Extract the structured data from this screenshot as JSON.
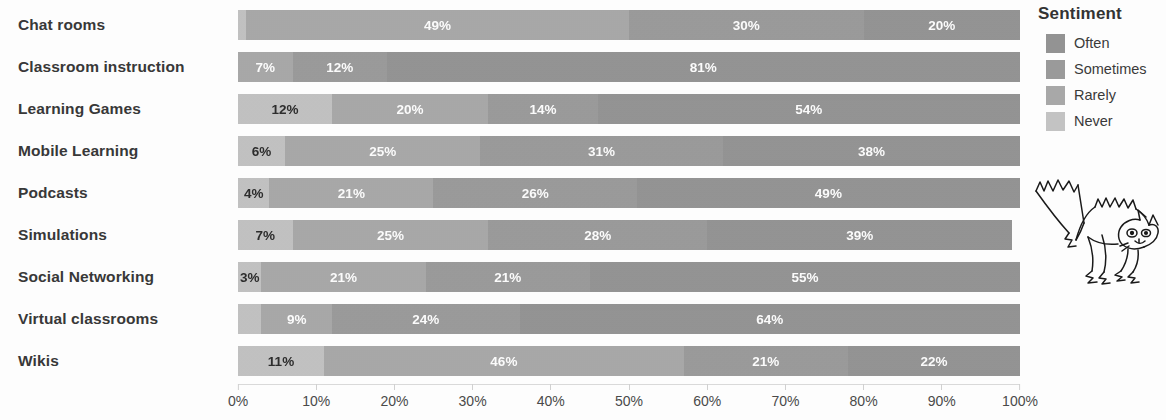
{
  "chart_data": {
    "type": "bar",
    "orientation": "horizontal",
    "stacked": true,
    "normalized": "100%",
    "title": "",
    "xlabel": "",
    "ylabel": "",
    "xlim": [
      0,
      100
    ],
    "grid": false,
    "legend_position": "right",
    "legend_title": "Sentiment",
    "x_ticks": [
      "0%",
      "10%",
      "20%",
      "30%",
      "40%",
      "50%",
      "60%",
      "70%",
      "80%",
      "90%",
      "100%"
    ],
    "x_tick_values": [
      0,
      10,
      20,
      30,
      40,
      50,
      60,
      70,
      80,
      90,
      100
    ],
    "categories": [
      "Chat rooms",
      "Classroom instruction",
      "Learning Games",
      "Mobile Learning",
      "Podcasts",
      "Simulations",
      "Social Networking",
      "Virtual classrooms",
      "Wikis"
    ],
    "series": [
      {
        "name": "Never",
        "color": "#c3c3c3",
        "values": [
          1,
          0,
          12,
          6,
          4,
          7,
          3,
          3,
          11
        ]
      },
      {
        "name": "Rarely",
        "color": "#a8a8a8",
        "values": [
          49,
          7,
          20,
          25,
          21,
          25,
          21,
          9,
          46
        ]
      },
      {
        "name": "Sometimes",
        "color": "#9a9a9a",
        "values": [
          30,
          12,
          14,
          31,
          26,
          28,
          21,
          24,
          21
        ]
      },
      {
        "name": "Often",
        "color": "#939393",
        "values": [
          20,
          81,
          54,
          38,
          49,
          39,
          55,
          64,
          22
        ]
      }
    ],
    "bars": [
      {
        "category": "Chat rooms",
        "segments": [
          {
            "series": "Never",
            "value": 1,
            "label": "",
            "show_label": false
          },
          {
            "series": "Rarely",
            "value": 49,
            "label": "49%",
            "show_label": true
          },
          {
            "series": "Sometimes",
            "value": 30,
            "label": "30%",
            "show_label": true
          },
          {
            "series": "Often",
            "value": 20,
            "label": "20%",
            "show_label": true
          }
        ]
      },
      {
        "category": "Classroom instruction",
        "segments": [
          {
            "series": "Never",
            "value": 0,
            "label": "",
            "show_label": false
          },
          {
            "series": "Rarely",
            "value": 7,
            "label": "7%",
            "show_label": true
          },
          {
            "series": "Sometimes",
            "value": 12,
            "label": "12%",
            "show_label": true
          },
          {
            "series": "Often",
            "value": 81,
            "label": "81%",
            "show_label": true
          }
        ]
      },
      {
        "category": "Learning Games",
        "segments": [
          {
            "series": "Never",
            "value": 12,
            "label": "12%",
            "show_label": true
          },
          {
            "series": "Rarely",
            "value": 20,
            "label": "20%",
            "show_label": true
          },
          {
            "series": "Sometimes",
            "value": 14,
            "label": "14%",
            "show_label": true
          },
          {
            "series": "Often",
            "value": 54,
            "label": "54%",
            "show_label": true
          }
        ]
      },
      {
        "category": "Mobile Learning",
        "segments": [
          {
            "series": "Never",
            "value": 6,
            "label": "6%",
            "show_label": true
          },
          {
            "series": "Rarely",
            "value": 25,
            "label": "25%",
            "show_label": true
          },
          {
            "series": "Sometimes",
            "value": 31,
            "label": "31%",
            "show_label": true
          },
          {
            "series": "Often",
            "value": 38,
            "label": "38%",
            "show_label": true
          }
        ]
      },
      {
        "category": "Podcasts",
        "segments": [
          {
            "series": "Never",
            "value": 4,
            "label": "4%",
            "show_label": true
          },
          {
            "series": "Rarely",
            "value": 21,
            "label": "21%",
            "show_label": true
          },
          {
            "series": "Sometimes",
            "value": 26,
            "label": "26%",
            "show_label": true
          },
          {
            "series": "Often",
            "value": 49,
            "label": "49%",
            "show_label": true
          }
        ]
      },
      {
        "category": "Simulations",
        "segments": [
          {
            "series": "Never",
            "value": 7,
            "label": "7%",
            "show_label": true
          },
          {
            "series": "Rarely",
            "value": 25,
            "label": "25%",
            "show_label": true
          },
          {
            "series": "Sometimes",
            "value": 28,
            "label": "28%",
            "show_label": true
          },
          {
            "series": "Often",
            "value": 39,
            "label": "39%",
            "show_label": true
          }
        ]
      },
      {
        "category": "Social Networking",
        "segments": [
          {
            "series": "Never",
            "value": 3,
            "label": "3%",
            "show_label": true
          },
          {
            "series": "Rarely",
            "value": 21,
            "label": "21%",
            "show_label": true
          },
          {
            "series": "Sometimes",
            "value": 21,
            "label": "21%",
            "show_label": true
          },
          {
            "series": "Often",
            "value": 55,
            "label": "55%",
            "show_label": true
          }
        ]
      },
      {
        "category": "Virtual classrooms",
        "segments": [
          {
            "series": "Never",
            "value": 3,
            "label": "",
            "show_label": false
          },
          {
            "series": "Rarely",
            "value": 9,
            "label": "9%",
            "show_label": true
          },
          {
            "series": "Sometimes",
            "value": 24,
            "label": "24%",
            "show_label": true
          },
          {
            "series": "Often",
            "value": 64,
            "label": "64%",
            "show_label": true
          }
        ]
      },
      {
        "category": "Wikis",
        "segments": [
          {
            "series": "Never",
            "value": 11,
            "label": "11%",
            "show_label": true
          },
          {
            "series": "Rarely",
            "value": 46,
            "label": "46%",
            "show_label": true
          },
          {
            "series": "Sometimes",
            "value": 21,
            "label": "21%",
            "show_label": true
          },
          {
            "series": "Often",
            "value": 22,
            "label": "22%",
            "show_label": true
          }
        ]
      }
    ]
  },
  "legend": {
    "title": "Sentiment",
    "items": [
      {
        "label": "Often",
        "color": "#939393"
      },
      {
        "label": "Sometimes",
        "color": "#9a9a9a"
      },
      {
        "label": "Rarely",
        "color": "#a8a8a8"
      },
      {
        "label": "Never",
        "color": "#c3c3c3"
      }
    ]
  },
  "decoration": {
    "cat_drawing": "line-drawing of an arched-back startled cat"
  },
  "colors": {
    "often": "#939393",
    "sometimes": "#9a9a9a",
    "rarely": "#a8a8a8",
    "never": "#c3c3c3",
    "label_text": "#383838",
    "axis_text": "#4a4a4a",
    "background": "#ffffff"
  }
}
